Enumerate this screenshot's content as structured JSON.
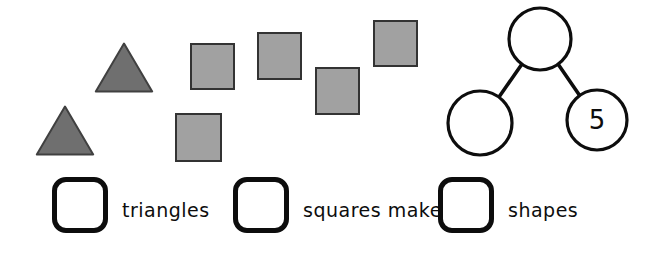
{
  "colors": {
    "background": "#ffffff",
    "triangle_fill": "#6f6f6f",
    "triangle_stroke": "#404040",
    "square_fill": "#a1a1a1",
    "square_stroke": "#333333",
    "bond_stroke": "#0d0d0d",
    "box_border": "#0d0d0d",
    "text": "#0d0d0d"
  },
  "shapes": {
    "triangles": {
      "count": 2,
      "positions": [
        {
          "x": 94,
          "y": 42,
          "w": 60,
          "h": 51
        },
        {
          "x": 35,
          "y": 105,
          "w": 60,
          "h": 51
        }
      ]
    },
    "squares": {
      "count": 5,
      "positions": [
        {
          "x": 190,
          "y": 43,
          "w": 45,
          "h": 47
        },
        {
          "x": 257,
          "y": 32,
          "w": 45,
          "h": 48
        },
        {
          "x": 315,
          "y": 67,
          "w": 45,
          "h": 48
        },
        {
          "x": 373,
          "y": 20,
          "w": 45,
          "h": 47
        },
        {
          "x": 175,
          "y": 113,
          "w": 47,
          "h": 49
        }
      ]
    }
  },
  "number_bond": {
    "whole_value": "",
    "left_part_value": "",
    "right_part_value": "5"
  },
  "fill_in": {
    "items": [
      {
        "label": "triangles",
        "value": ""
      },
      {
        "label": "squares make",
        "value": ""
      },
      {
        "label": "shapes",
        "value": ""
      }
    ]
  }
}
